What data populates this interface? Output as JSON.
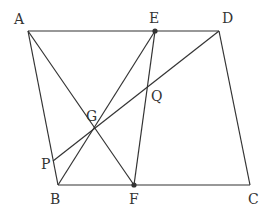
{
  "diagram": {
    "type": "geometry",
    "stroke_color": "#333333",
    "points": {
      "A": {
        "label": "A",
        "x": 28,
        "y": 31,
        "lx": 14,
        "ly": 24
      },
      "E": {
        "label": "E",
        "x": 155,
        "y": 31,
        "lx": 149,
        "ly": 23,
        "dot": true
      },
      "D": {
        "label": "D",
        "x": 219,
        "y": 31,
        "lx": 222,
        "ly": 23
      },
      "B": {
        "label": "B",
        "x": 58,
        "y": 185,
        "lx": 50,
        "ly": 204
      },
      "F": {
        "label": "F",
        "x": 134,
        "y": 185,
        "lx": 129,
        "ly": 204,
        "dot": true
      },
      "C": {
        "label": "C",
        "x": 250,
        "y": 185,
        "lx": 248,
        "ly": 204
      },
      "P": {
        "label": "P",
        "x": 53,
        "y": 161,
        "lx": 41,
        "ly": 169
      },
      "G": {
        "label": "G",
        "x": 93,
        "y": 128,
        "lx": 86,
        "ly": 121
      },
      "Q": {
        "label": "Q",
        "x": 148,
        "y": 88,
        "lx": 151,
        "ly": 101
      }
    },
    "segments": [
      [
        "A",
        "D"
      ],
      [
        "A",
        "B"
      ],
      [
        "B",
        "C"
      ],
      [
        "D",
        "C"
      ],
      [
        "A",
        "F"
      ],
      [
        "E",
        "B"
      ],
      [
        "E",
        "F"
      ],
      [
        "D",
        "P"
      ]
    ]
  }
}
